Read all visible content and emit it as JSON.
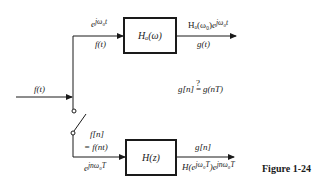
{
  "diagram": {
    "input_label": "f(t)",
    "analog_path": {
      "input_exp": "e^{jω₀t}",
      "input_exp_base": "e",
      "input_exp_sup": "jω₀t",
      "input_signal": "f(t)",
      "block_label": "Hₐ(ω)",
      "output_expr_prefix": "Hₐ(ω₀)",
      "output_expr_base": "e",
      "output_expr_sup": "jω₀t",
      "output_signal": "g(t)"
    },
    "comparison": "g[n] ≟ g(nT)",
    "comparison_left": "g[n]",
    "comparison_q": "?",
    "comparison_eq": "=",
    "comparison_right": "g(nT)",
    "digital_path": {
      "sampled_line1": "f[n]",
      "sampled_line2": "= f(nt)",
      "input_exp_base": "e",
      "input_exp_sup": "jnω₀T",
      "block_label": "H(z)",
      "output_signal": "g[n]",
      "output_expr_H": "H(e",
      "output_expr_H_sup": "jω₀T",
      "output_expr_mid": ")e",
      "output_expr_sup": "jnω₀T"
    },
    "figure_caption": "Figure 1-24"
  }
}
